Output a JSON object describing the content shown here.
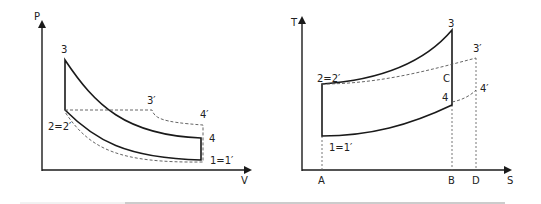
{
  "pv_diagram": {
    "axes": {
      "y_label": "P",
      "x_label": "V"
    },
    "points": {
      "p3": "3",
      "p2": "2=2′",
      "p4": "4",
      "p1": "1=1′",
      "p3prime": "3′",
      "p4prime": "4′"
    }
  },
  "ts_diagram": {
    "axes": {
      "y_label": "T",
      "x_label": "S"
    },
    "points": {
      "p3": "3",
      "p2": "2=2′",
      "pC": "C",
      "p4": "4",
      "p1": "1=1′",
      "p3prime": "3′",
      "p4prime": "4′"
    },
    "x_ticks": [
      "A",
      "B",
      "D"
    ]
  },
  "colors": {
    "line": "#1a1a1a",
    "dashed": "#555555",
    "separator": "#999999"
  }
}
